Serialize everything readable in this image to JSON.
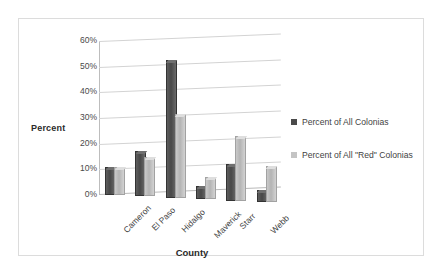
{
  "chart_data": {
    "type": "bar",
    "title": "",
    "xlabel": "County",
    "ylabel": "Percent",
    "categories": [
      "Cameron",
      "El Paso",
      "Hidalgo",
      "Maverick",
      "Starr",
      "Webb"
    ],
    "series": [
      {
        "name": "Percent of All Colonias",
        "color": "#4a4a4a",
        "values": [
          10,
          17,
          53,
          4.5,
          13.5,
          4
        ]
      },
      {
        "name": "Percent of All \"Red\" Colonias",
        "color": "#c4c4c4",
        "values": [
          10,
          14.5,
          32,
          8,
          24.5,
          13.5
        ]
      }
    ],
    "ylim": [
      0,
      60
    ],
    "yticks": [
      "0%",
      "10%",
      "20%",
      "30%",
      "40%",
      "50%",
      "60%"
    ],
    "ytick_values": [
      0,
      10,
      20,
      30,
      40,
      50,
      60
    ],
    "grid": true,
    "legend_position": "right"
  },
  "legend": {
    "items": [
      {
        "label": "Percent of All Colonias",
        "swatch": "dark-gray-swatch"
      },
      {
        "label": "Percent of All \"Red\" Colonias",
        "swatch": "light-gray-swatch"
      }
    ]
  }
}
